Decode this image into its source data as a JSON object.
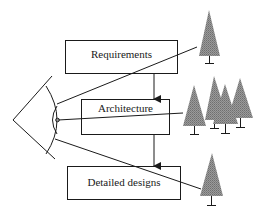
{
  "diagram": {
    "boxes": [
      {
        "id": "requirements",
        "label": "Requirements",
        "x": 65,
        "y": 40,
        "w": 112,
        "h": 33
      },
      {
        "id": "architecture",
        "label": "Architecture",
        "x": 81,
        "y": 99,
        "w": 88,
        "h": 35
      },
      {
        "id": "detailed_designs",
        "label": "Detailed designs",
        "x": 67,
        "y": 166,
        "w": 113,
        "h": 33
      }
    ],
    "arrows": [
      {
        "from": "requirements",
        "to": "architecture"
      },
      {
        "from": "architecture",
        "to": "detailed_designs"
      }
    ],
    "observer": {
      "icon": "eye-icon"
    },
    "sight_lines": [
      {
        "target": "single-tree-top"
      },
      {
        "target": "tree-cluster"
      },
      {
        "target": "single-tree-bottom"
      }
    ],
    "trees": {
      "top": 1,
      "cluster": 4,
      "bottom": 1
    },
    "colors": {
      "line": "#1a1a1a",
      "tree_fill": "#8a8a8a",
      "background": "#ffffff"
    }
  }
}
